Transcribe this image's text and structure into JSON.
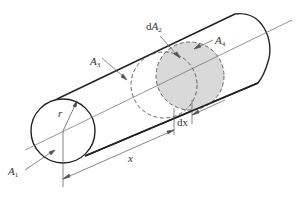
{
  "diagram": {
    "labels": {
      "A1": {
        "main": "A",
        "sub": "1"
      },
      "dA2": {
        "prefix": "d",
        "main": "A",
        "sub": "2"
      },
      "A3": {
        "main": "A",
        "sub": "3"
      },
      "A4": {
        "main": "A",
        "sub": "4"
      },
      "r": "r",
      "x": "x",
      "dx": "dx"
    },
    "colors": {
      "stroke": "#222222",
      "thin": "#555555",
      "disc_fill": "#d9d9d9",
      "background": "#ffffff"
    }
  }
}
